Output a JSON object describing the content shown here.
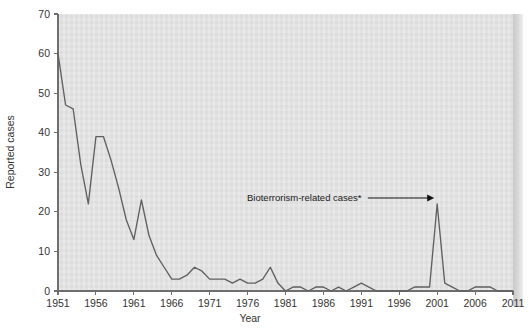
{
  "chart_data": {
    "type": "line",
    "title": "",
    "xlabel": "Year",
    "ylabel": "Reported cases",
    "xlim": [
      1951,
      2011
    ],
    "ylim": [
      0,
      70
    ],
    "grid": false,
    "legend": null,
    "xticks": [
      1951,
      1956,
      1961,
      1966,
      1971,
      1976,
      1981,
      1986,
      1991,
      1996,
      2001,
      2006,
      2011
    ],
    "yticks": [
      0,
      10,
      20,
      30,
      40,
      50,
      60,
      70
    ],
    "annotations": [
      {
        "text": "Bioterrorism-related cases*",
        "points_to_year": 2001,
        "points_to_value": 22
      }
    ],
    "series": [
      {
        "name": "Reported cases",
        "x": [
          1951,
          1952,
          1953,
          1954,
          1955,
          1956,
          1957,
          1958,
          1959,
          1960,
          1961,
          1962,
          1963,
          1964,
          1965,
          1966,
          1967,
          1968,
          1969,
          1970,
          1971,
          1972,
          1973,
          1974,
          1975,
          1976,
          1977,
          1978,
          1979,
          1980,
          1981,
          1982,
          1983,
          1984,
          1985,
          1986,
          1987,
          1988,
          1989,
          1990,
          1991,
          1992,
          1993,
          1994,
          1995,
          1996,
          1997,
          1998,
          1999,
          2000,
          2001,
          2002,
          2003,
          2004,
          2005,
          2006,
          2007,
          2008,
          2009,
          2010,
          2011
        ],
        "y": [
          60,
          47,
          46,
          32,
          22,
          39,
          39,
          33,
          26,
          18,
          13,
          23,
          14,
          9,
          6,
          3,
          3,
          4,
          6,
          5,
          3,
          3,
          3,
          2,
          3,
          2,
          2,
          3,
          6,
          2,
          0,
          1,
          1,
          0,
          1,
          1,
          0,
          1,
          0,
          1,
          2,
          1,
          0,
          0,
          0,
          0,
          0,
          1,
          1,
          1,
          22,
          2,
          1,
          0,
          0,
          1,
          1,
          1,
          0,
          0,
          0
        ]
      }
    ],
    "plot_bg_color": "#e2e2e2",
    "line_color": "#606060",
    "axis_color": "#6e6e6e"
  }
}
